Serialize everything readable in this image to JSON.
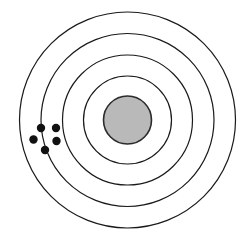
{
  "figure": {
    "width": 250,
    "height": 242,
    "background_color": "#ffffff",
    "center_x": 127.5,
    "center_y": 120
  },
  "nucleus": {
    "name": "nucleus",
    "radius": 24,
    "fill_color": "#b9b9b9",
    "stroke_color": "#2b2b2b",
    "stroke_width": 1.6
  },
  "shells": [
    {
      "label": "shell-1",
      "radius": 44,
      "stroke_color": "#1a1a1a",
      "stroke_width": 1.2
    },
    {
      "label": "shell-2",
      "radius": 65,
      "stroke_color": "#1a1a1a",
      "stroke_width": 1.2
    },
    {
      "label": "shell-3",
      "radius": 86.5,
      "stroke_color": "#1a1a1a",
      "stroke_width": 1.2
    },
    {
      "label": "shell-4",
      "radius": 108,
      "stroke_color": "#1a1a1a",
      "stroke_width": 1.2
    }
  ],
  "electrons": {
    "count": 5,
    "fill_color": "#111111",
    "radius": 4.2,
    "positions": [
      {
        "label": "electron-1",
        "cx": 41,
        "cy": 128
      },
      {
        "label": "electron-2",
        "cx": 56,
        "cy": 128
      },
      {
        "label": "electron-3",
        "cx": 33.5,
        "cy": 139.5
      },
      {
        "label": "electron-4",
        "cx": 56.5,
        "cy": 141
      },
      {
        "label": "electron-5",
        "cx": 45,
        "cy": 150
      }
    ]
  },
  "chart_data": {
    "type": "diagram",
    "shell_count": 4,
    "shell_radii": [
      44,
      65,
      86.5,
      108
    ],
    "nucleus_radius": 24,
    "electron_count": 5,
    "legend": [],
    "xlabel": "",
    "ylabel": ""
  }
}
